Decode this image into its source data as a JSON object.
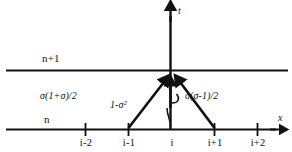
{
  "figure": {
    "background_color": "#ffffff",
    "line_color": "#111111",
    "width": 292,
    "height": 152
  },
  "axes": {
    "x_axis_label": "x",
    "t_axis_label": "t"
  },
  "levels": [
    {
      "id": "upper",
      "label": "n+1"
    },
    {
      "id": "lower",
      "label": "n"
    }
  ],
  "ticks": [
    {
      "label": "i-2",
      "x": 85
    },
    {
      "label": "i-1",
      "x": 128
    },
    {
      "label": "i",
      "x": 171
    },
    {
      "label": "i+1",
      "x": 214
    },
    {
      "label": "i+2",
      "x": 257
    },
    {
      "label": "",
      "x": 300
    }
  ],
  "coefficients": [
    {
      "id": "left",
      "text_plain": "σ(1+σ)/2",
      "source_tick": "i-1"
    },
    {
      "id": "center",
      "text_plain": "1-σ²",
      "source_tick": "i"
    },
    {
      "id": "right",
      "text_plain": "σ(σ-1)/2",
      "source_tick": "i+1"
    }
  ]
}
